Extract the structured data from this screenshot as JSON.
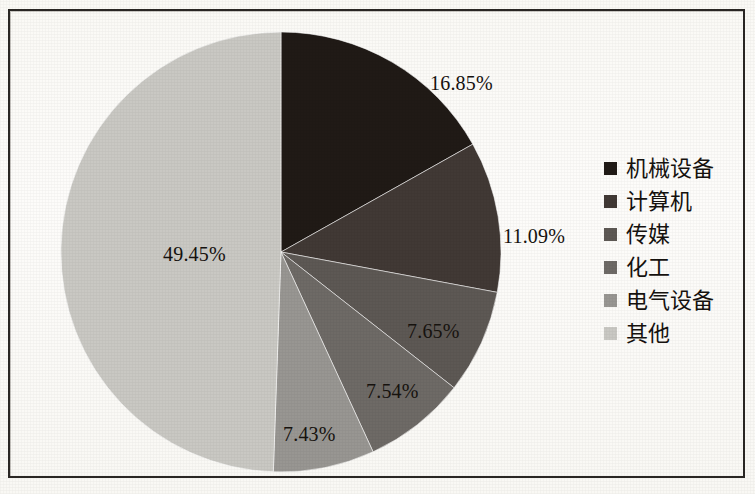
{
  "chart_data": {
    "type": "pie",
    "title": "",
    "subtitle": "",
    "xlabel": "",
    "ylabel": "",
    "legend_position": "right",
    "grid": false,
    "start_angle_deg": 0,
    "direction": "clockwise",
    "categories": [
      "机械设备",
      "计算机",
      "传媒",
      "化工",
      "电气设备",
      "其他"
    ],
    "values": [
      16.85,
      11.09,
      7.65,
      7.54,
      7.43,
      49.45
    ],
    "value_labels": [
      "16.85%",
      "11.09%",
      "7.65%",
      "7.54%",
      "7.43%",
      "49.45%"
    ],
    "colors": [
      "#201a16",
      "#413935",
      "#5d5854",
      "#6e6a66",
      "#989692",
      "#c9c8c3"
    ],
    "slices": [
      {
        "label": "机械设备",
        "value": 16.85,
        "value_label": "16.85%",
        "color": "#201a16"
      },
      {
        "label": "计算机",
        "value": 11.09,
        "value_label": "11.09%",
        "color": "#413935"
      },
      {
        "label": "传媒",
        "value": 7.65,
        "value_label": "7.65%",
        "color": "#5d5854"
      },
      {
        "label": "化工",
        "value": 7.54,
        "value_label": "7.54%",
        "color": "#6e6a66"
      },
      {
        "label": "电气设备",
        "value": 7.43,
        "value_label": "7.43%",
        "color": "#989692"
      },
      {
        "label": "其他",
        "value": 49.45,
        "value_label": "49.45%",
        "color": "#c9c8c3"
      }
    ]
  },
  "legend": {
    "items": [
      {
        "label": "机械设备",
        "color": "#201a16"
      },
      {
        "label": "计算机",
        "color": "#413935"
      },
      {
        "label": "传媒",
        "color": "#5d5854"
      },
      {
        "label": "化工",
        "color": "#6e6a66"
      },
      {
        "label": "电气设备",
        "color": "#989692"
      },
      {
        "label": "其他",
        "color": "#c9c8c3"
      }
    ]
  },
  "labels": {
    "l0": "16.85%",
    "l1": "11.09%",
    "l2": "7.65%",
    "l3": "7.54%",
    "l4": "7.43%",
    "l5": "49.45%"
  }
}
